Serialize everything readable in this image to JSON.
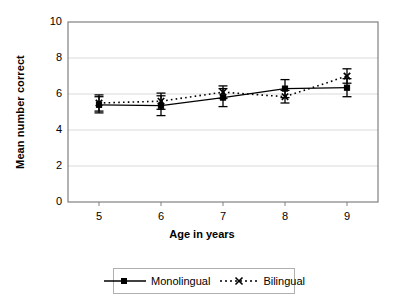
{
  "chart_data": {
    "type": "line",
    "title": "",
    "xlabel": "Age in years",
    "ylabel": "Mean number correct",
    "categories": [
      "5",
      "6",
      "7",
      "8",
      "9"
    ],
    "x": [
      5,
      6,
      7,
      8,
      9
    ],
    "xlim": [
      4.5,
      9.5
    ],
    "ylim": [
      0,
      10
    ],
    "yticks": [
      "0",
      "2",
      "4",
      "6",
      "8",
      "10"
    ],
    "ytick_values": [
      0,
      2,
      4,
      6,
      8,
      10
    ],
    "grid": "horizontal",
    "legend_position": "bottom",
    "series": [
      {
        "name": "Monolingual",
        "marker": "square",
        "line": "solid",
        "color": "#000000",
        "values": [
          5.4,
          5.35,
          5.8,
          6.3,
          6.35
        ],
        "errors": [
          0.45,
          0.55,
          0.5,
          0.5,
          0.5
        ]
      },
      {
        "name": "Bilingual",
        "marker": "cross",
        "line": "dotted",
        "color": "#000000",
        "values": [
          5.5,
          5.6,
          6.1,
          5.85,
          7.0
        ],
        "errors": [
          0.45,
          0.45,
          0.35,
          0.35,
          0.4
        ]
      }
    ]
  },
  "axis": {
    "y_title": "Mean number correct",
    "x_title": "Age in years"
  },
  "legend": {
    "items": [
      {
        "label": "Monolingual"
      },
      {
        "label": "Bilingual"
      }
    ]
  },
  "colors": {
    "frame": "#808080",
    "grid": "#d9d9d9",
    "series": "#000000",
    "background": "#ffffff"
  }
}
